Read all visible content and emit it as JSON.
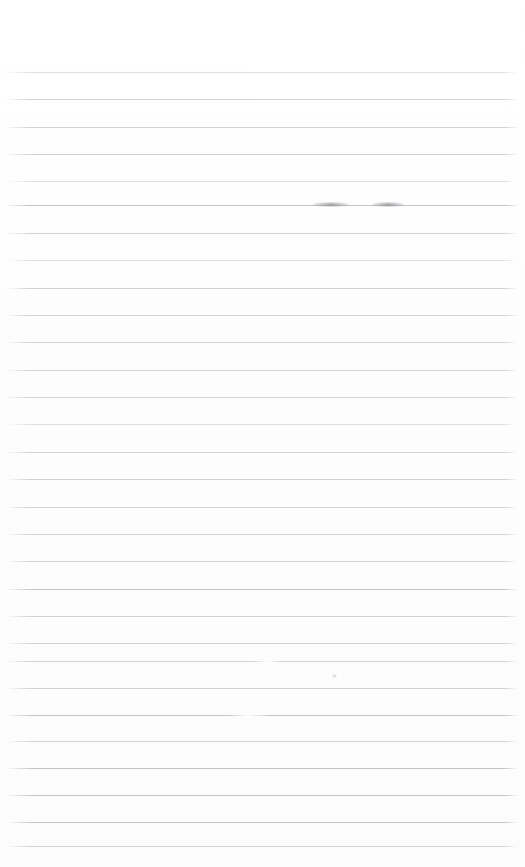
{
  "document": {
    "type": "scanned-lined-paper",
    "description": "Blank ruled notebook page scan",
    "visible_text": "",
    "page_width": 525,
    "page_height": 867,
    "background_color": "#fefefe"
  },
  "ruling": {
    "line_color": "#c9cbcf",
    "line_count": 29,
    "first_line_y": 72,
    "line_spacing": 27.3,
    "line_left_x": 6,
    "line_right_x": 517,
    "line_thickness": 1,
    "top_margin": 72,
    "bottom_margin": 21,
    "lines": [
      {
        "y": 72,
        "tone": "lighter",
        "left": 6,
        "right": 517
      },
      {
        "y": 99,
        "tone": "normal",
        "left": 5,
        "right": 518
      },
      {
        "y": 127,
        "tone": "normal",
        "left": 4,
        "right": 519
      },
      {
        "y": 154,
        "tone": "normal",
        "left": 5,
        "right": 518
      },
      {
        "y": 181,
        "tone": "lighter",
        "left": 6,
        "right": 517
      },
      {
        "y": 205,
        "tone": "darker",
        "left": 4,
        "right": 519
      },
      {
        "y": 233,
        "tone": "normal",
        "left": 5,
        "right": 518
      },
      {
        "y": 260,
        "tone": "lighter",
        "left": 6,
        "right": 517
      },
      {
        "y": 288,
        "tone": "normal",
        "left": 5,
        "right": 518
      },
      {
        "y": 315,
        "tone": "normal",
        "left": 4,
        "right": 519
      },
      {
        "y": 342,
        "tone": "normal",
        "left": 5,
        "right": 518
      },
      {
        "y": 370,
        "tone": "normal",
        "left": 5,
        "right": 518
      },
      {
        "y": 397,
        "tone": "normal",
        "left": 4,
        "right": 518
      },
      {
        "y": 424,
        "tone": "lighter",
        "left": 6,
        "right": 517
      },
      {
        "y": 452,
        "tone": "normal",
        "left": 5,
        "right": 518
      },
      {
        "y": 479,
        "tone": "normal",
        "left": 5,
        "right": 519
      },
      {
        "y": 507,
        "tone": "normal",
        "left": 4,
        "right": 518
      },
      {
        "y": 534,
        "tone": "normal",
        "left": 5,
        "right": 519
      },
      {
        "y": 561,
        "tone": "normal",
        "left": 5,
        "right": 518
      },
      {
        "y": 589,
        "tone": "darker",
        "left": 5,
        "right": 518
      },
      {
        "y": 616,
        "tone": "normal",
        "left": 5,
        "right": 519
      },
      {
        "y": 643,
        "tone": "normal",
        "left": 5,
        "right": 518
      },
      {
        "y": 661,
        "tone": "normal",
        "left": 6,
        "right": 518
      },
      {
        "y": 688,
        "tone": "normal",
        "left": 5,
        "right": 518
      },
      {
        "y": 715,
        "tone": "darker",
        "left": 5,
        "right": 519
      },
      {
        "y": 741,
        "tone": "normal",
        "left": 6,
        "right": 518
      },
      {
        "y": 768,
        "tone": "darker",
        "left": 5,
        "right": 518
      },
      {
        "y": 795,
        "tone": "darker",
        "left": 5,
        "right": 519
      },
      {
        "y": 822,
        "tone": "darker",
        "left": 6,
        "right": 518
      },
      {
        "y": 846,
        "tone": "normal",
        "left": 6,
        "right": 517
      }
    ]
  },
  "artifacts": {
    "smudges": [
      {
        "x": 313,
        "y": 202,
        "width": 36,
        "height": 5
      },
      {
        "x": 372,
        "y": 202,
        "width": 32,
        "height": 5
      }
    ],
    "specks": [
      {
        "x": 332,
        "y": 674,
        "width": 5,
        "height": 4
      }
    ],
    "line_breaks": [
      {
        "x": 228,
        "y": 714,
        "width": 42,
        "height": 3
      },
      {
        "x": 252,
        "y": 660,
        "width": 30,
        "height": 3
      }
    ]
  }
}
